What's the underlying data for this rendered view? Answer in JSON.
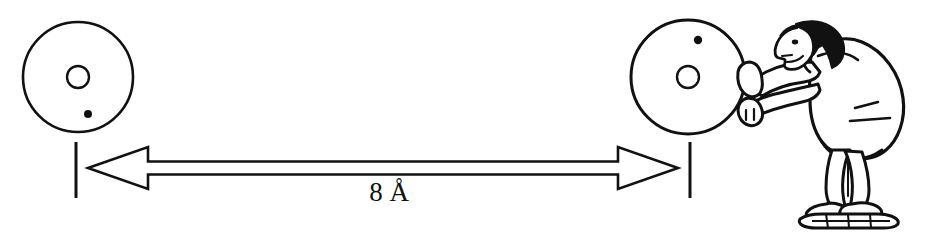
{
  "figure": {
    "background_color": "#ffffff",
    "ink_color": "#111111",
    "measurement": {
      "value": "8",
      "unit": "Å",
      "label": "8 Å",
      "arrow_style": "double-headed-outline",
      "left_tick_x": 76,
      "right_tick_x": 690
    },
    "left_disk": {
      "name": "left-disk",
      "center_x": 78,
      "center_y": 77,
      "radius": 55,
      "hole_radius": 11,
      "dot": {
        "x": 88,
        "y": 114,
        "r": 4
      }
    },
    "right_disk": {
      "name": "right-disk",
      "center_x": 688,
      "center_y": 77,
      "radius": 57,
      "hole_radius": 11,
      "dot": {
        "x": 698,
        "y": 40,
        "r": 4
      }
    },
    "person": {
      "name": "person-pushing-disk",
      "description": "Man in a coat leaning forward on a skateboard, pushing the right disk with both hands",
      "wears": "skateboard"
    }
  }
}
